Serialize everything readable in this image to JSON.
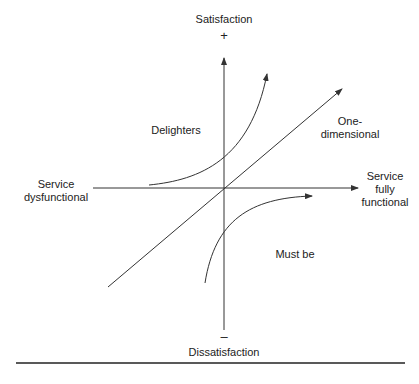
{
  "diagram": {
    "type": "Kano model",
    "axes": {
      "y_top": "Satisfaction",
      "y_top_sign": "+",
      "y_bottom": "Dissatisfaction",
      "y_bottom_sign": "–",
      "x_left": [
        "Service",
        "dysfunctional"
      ],
      "x_right": [
        "Service",
        "fully",
        "functional"
      ]
    },
    "curves": {
      "delighters": "Delighters",
      "one_dimensional": [
        "One-",
        "dimensional"
      ],
      "must_be": "Must be"
    },
    "colors": {
      "line": "#333333",
      "text": "#222222"
    }
  }
}
